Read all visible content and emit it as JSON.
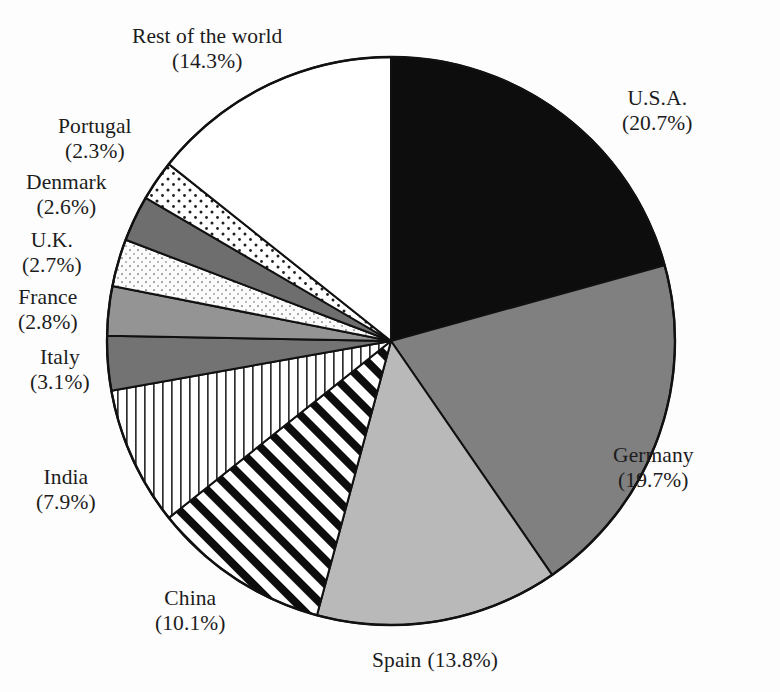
{
  "chart_data": {
    "type": "pie",
    "title": "",
    "subtitle": "",
    "xlabel": "",
    "ylabel": "",
    "legend_position": "none",
    "grid": false,
    "unit": "%",
    "start_angle_deg": 0,
    "direction": "clockwise",
    "categories": [
      "U.S.A.",
      "Germany",
      "Spain",
      "China",
      "India",
      "Italy",
      "France",
      "U.K.",
      "Denmark",
      "Portugal",
      "Rest of the world"
    ],
    "values": [
      20.7,
      19.7,
      13.8,
      10.1,
      7.9,
      3.1,
      2.8,
      2.7,
      2.6,
      2.3,
      14.3
    ],
    "slices": [
      {
        "label": "U.S.A.",
        "percent": 20.7,
        "percent_text": "(20.7%)",
        "fill_style": "solid-black",
        "fill_color": "#0d0d0d",
        "label_layout": "stacked",
        "label_left": 622,
        "label_top": 86
      },
      {
        "label": "Germany",
        "percent": 19.7,
        "percent_text": "(19.7%)",
        "fill_style": "solid-gray-dark",
        "fill_color": "#808080",
        "label_layout": "stacked",
        "label_left": 613,
        "label_top": 443
      },
      {
        "label": "Spain",
        "percent": 13.8,
        "percent_text": "(13.8%)",
        "fill_style": "solid-gray-light",
        "fill_color": "#b9b9b9",
        "label_layout": "inline",
        "label_left": 372,
        "label_top": 648
      },
      {
        "label": "China",
        "percent": 10.1,
        "percent_text": "(10.1%)",
        "fill_style": "diagonal-stripes-bold",
        "fill_color": "#ffffff",
        "label_layout": "stacked",
        "label_left": 155,
        "label_top": 586
      },
      {
        "label": "India",
        "percent": 7.9,
        "percent_text": "(7.9%)",
        "fill_style": "vertical-lines",
        "fill_color": "#ffffff",
        "label_layout": "stacked",
        "label_left": 36,
        "label_top": 465
      },
      {
        "label": "Italy",
        "percent": 3.1,
        "percent_text": "(3.1%)",
        "fill_style": "solid-gray-dark2",
        "fill_color": "#737373",
        "label_layout": "stacked",
        "label_left": 30,
        "label_top": 345
      },
      {
        "label": "France",
        "percent": 2.8,
        "percent_text": "(2.8%)",
        "fill_style": "solid-gray-mid",
        "fill_color": "#949494",
        "label_layout": "stacked",
        "label_left": 18,
        "label_top": 285
      },
      {
        "label": "U.K.",
        "percent": 2.7,
        "percent_text": "(2.7%)",
        "fill_style": "fine-dots-light",
        "fill_color": "#fbfbfb",
        "label_layout": "stacked",
        "label_left": 22,
        "label_top": 228
      },
      {
        "label": "Denmark",
        "percent": 2.6,
        "percent_text": "(2.6%)",
        "fill_style": "solid-gray-dark3",
        "fill_color": "#6e6e6e",
        "label_layout": "stacked",
        "label_left": 26,
        "label_top": 170
      },
      {
        "label": "Portugal",
        "percent": 2.3,
        "percent_text": "(2.3%)",
        "fill_style": "sparse-dots",
        "fill_color": "#ffffff",
        "label_layout": "stacked",
        "label_left": 58,
        "label_top": 114
      },
      {
        "label": "Rest of the world",
        "percent": 14.3,
        "percent_text": "(14.3%)",
        "fill_style": "white",
        "fill_color": "#ffffff",
        "label_layout": "stacked",
        "label_left": 132,
        "label_top": 24
      }
    ]
  },
  "geometry": {
    "center_x": 391,
    "center_y": 341,
    "radius": 284,
    "stroke_color": "#111111",
    "stroke_width": 2
  },
  "background": {
    "color": "#fdfdfd"
  }
}
